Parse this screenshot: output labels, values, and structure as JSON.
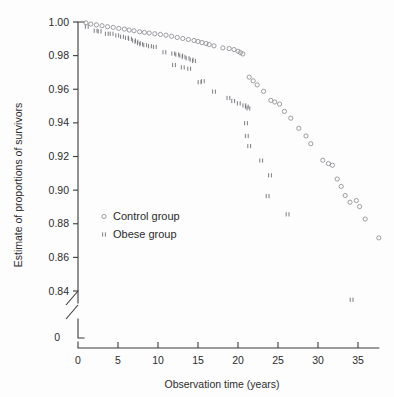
{
  "chart_data": {
    "type": "scatter",
    "title": "",
    "xlabel": "Observation time (years)",
    "ylabel": "Estimate of proportions of survivors",
    "xlim": [
      0,
      38.5
    ],
    "ylim": [
      0.83,
      1.0
    ],
    "xticks": [
      0,
      5,
      10,
      15,
      20,
      25,
      30,
      35
    ],
    "xticklabels": [
      "0",
      "5",
      "10",
      "15",
      "20",
      "25",
      "30",
      "35"
    ],
    "yticks": [
      0.84,
      0.86,
      0.88,
      0.9,
      0.92,
      0.94,
      0.96,
      0.98,
      1.0
    ],
    "yticklabels": [
      "0.84",
      "0.86",
      "0.88",
      "0.90",
      "0.92",
      "0.94",
      "0.96",
      "0.98",
      "1.00"
    ],
    "y_axis_break": true,
    "y_origin_label": "0",
    "grid": false,
    "legend_position": "center-left",
    "series": [
      {
        "name": "Control group",
        "marker": "open-circle",
        "color": "#8d8d93",
        "points": [
          [
            1.0,
            0.9995
          ],
          [
            1.6,
            0.9988
          ],
          [
            2.3,
            0.9983
          ],
          [
            3.0,
            0.9978
          ],
          [
            3.7,
            0.9972
          ],
          [
            4.4,
            0.9968
          ],
          [
            5.1,
            0.9962
          ],
          [
            5.8,
            0.9958
          ],
          [
            6.4,
            0.9952
          ],
          [
            7.0,
            0.9948
          ],
          [
            7.7,
            0.9942
          ],
          [
            8.3,
            0.9938
          ],
          [
            8.9,
            0.9934
          ],
          [
            9.6,
            0.993
          ],
          [
            10.3,
            0.9926
          ],
          [
            11.0,
            0.9922
          ],
          [
            11.7,
            0.9915
          ],
          [
            12.4,
            0.9908
          ],
          [
            13.1,
            0.9902
          ],
          [
            13.8,
            0.9896
          ],
          [
            14.5,
            0.989
          ],
          [
            15.0,
            0.9884
          ],
          [
            15.5,
            0.9878
          ],
          [
            16.0,
            0.9872
          ],
          [
            16.4,
            0.9866
          ],
          [
            17.0,
            0.9858
          ],
          [
            18.1,
            0.9846
          ],
          [
            18.9,
            0.9842
          ],
          [
            19.5,
            0.9836
          ],
          [
            20.0,
            0.9826
          ],
          [
            20.3,
            0.9818
          ],
          [
            20.6,
            0.981
          ],
          [
            21.4,
            0.9672
          ],
          [
            21.9,
            0.965
          ],
          [
            22.4,
            0.9626
          ],
          [
            23.2,
            0.9588
          ],
          [
            24.1,
            0.9534
          ],
          [
            24.6,
            0.9524
          ],
          [
            25.2,
            0.9512
          ],
          [
            25.8,
            0.9468
          ],
          [
            26.6,
            0.9428
          ],
          [
            27.6,
            0.9368
          ],
          [
            28.5,
            0.9322
          ],
          [
            29.1,
            0.9276
          ],
          [
            30.6,
            0.9178
          ],
          [
            31.3,
            0.9158
          ],
          [
            31.8,
            0.9148
          ],
          [
            32.4,
            0.9066
          ],
          [
            32.9,
            0.9022
          ],
          [
            33.4,
            0.8968
          ],
          [
            34.0,
            0.8928
          ],
          [
            34.8,
            0.8938
          ],
          [
            35.2,
            0.8902
          ],
          [
            35.9,
            0.8828
          ],
          [
            37.6,
            0.8716
          ]
        ]
      },
      {
        "name": "Obese group",
        "marker": "double-tick",
        "color": "#6e6e74",
        "points": [
          [
            1.1,
            0.9972
          ],
          [
            2.2,
            0.9948
          ],
          [
            2.7,
            0.9944
          ],
          [
            3.6,
            0.993
          ],
          [
            4.2,
            0.993
          ],
          [
            4.9,
            0.992
          ],
          [
            5.5,
            0.9912
          ],
          [
            6.1,
            0.9906
          ],
          [
            6.5,
            0.99
          ],
          [
            7.0,
            0.989
          ],
          [
            7.3,
            0.9882
          ],
          [
            7.6,
            0.9874
          ],
          [
            7.9,
            0.9868
          ],
          [
            8.4,
            0.9862
          ],
          [
            9.0,
            0.9856
          ],
          [
            9.6,
            0.9852
          ],
          [
            10.8,
            0.982
          ],
          [
            11.9,
            0.9812
          ],
          [
            12.4,
            0.9806
          ],
          [
            12.9,
            0.98
          ],
          [
            13.2,
            0.9792
          ],
          [
            13.7,
            0.9784
          ],
          [
            14.2,
            0.9776
          ],
          [
            14.5,
            0.9768
          ],
          [
            12.0,
            0.9744
          ],
          [
            13.1,
            0.973
          ],
          [
            13.9,
            0.9722
          ],
          [
            15.2,
            0.9642
          ],
          [
            15.6,
            0.9648
          ],
          [
            17.0,
            0.9586
          ],
          [
            18.8,
            0.9548
          ],
          [
            19.4,
            0.953
          ],
          [
            20.1,
            0.9516
          ],
          [
            20.8,
            0.9504
          ],
          [
            21.1,
            0.9496
          ],
          [
            21.3,
            0.9486
          ],
          [
            21.0,
            0.9398
          ],
          [
            21.1,
            0.9322
          ],
          [
            21.4,
            0.9262
          ],
          [
            22.9,
            0.9176
          ],
          [
            24.0,
            0.9088
          ],
          [
            23.7,
            0.8964
          ],
          [
            26.2,
            0.8856
          ],
          [
            34.2,
            0.8348
          ]
        ]
      }
    ]
  },
  "legend": {
    "items": [
      {
        "label": "Control group",
        "marker": "open-circle"
      },
      {
        "label": "Obese group",
        "marker": "double-tick"
      }
    ]
  },
  "colors": {
    "axis": "#3a3a3a",
    "text": "#2b2b2b",
    "control_marker": "#8d8d93",
    "obese_marker": "#6e6e74",
    "background": "#fdfdfd"
  }
}
